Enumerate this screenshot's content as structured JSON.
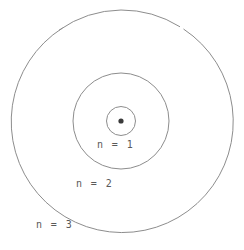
{
  "diagram": {
    "type": "atomic-shell-diagram",
    "canvas": {
      "width": 244,
      "height": 250,
      "background": "#ffffff"
    },
    "line_color": "#8d8d8d",
    "nucleus_color": "#3a3a3a",
    "label_color": "#5a5a5a",
    "center": {
      "x": 121,
      "y": 121
    },
    "nucleus": {
      "label": "nucleus",
      "radius": 2.6
    },
    "shells": [
      {
        "id": "n1",
        "label": "n = 1",
        "radius": 14.5,
        "label_x": 120,
        "label_y": 146
      },
      {
        "id": "n2",
        "label": "n = 2",
        "radius": 48,
        "label_x": 99,
        "label_y": 185
      },
      {
        "id": "n3",
        "label": "n = 3",
        "radius": 111,
        "label_x": 59,
        "label_y": 226
      }
    ]
  }
}
